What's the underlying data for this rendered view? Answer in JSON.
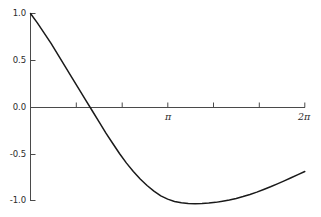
{
  "chart_data": {
    "type": "line",
    "title": "",
    "subtitle": "",
    "xlabel": "",
    "ylabel": "",
    "xlim": [
      0,
      6.283185307179586
    ],
    "ylim": [
      -1.0,
      1.0
    ],
    "grid": false,
    "legend": null,
    "background_color": "#ffffff",
    "line_color": "#1a1a1a",
    "axis_color": "#555555",
    "x_tick_positions": [
      0,
      1.0471975512,
      2.0943951024,
      3.1415926536,
      4.1887902048,
      5.235987756,
      6.2831853072
    ],
    "x_tick_labels": [
      "",
      "",
      "",
      "π",
      "",
      "",
      "2π"
    ],
    "x_labeled_ticks": [
      {
        "value": 3.1415926536,
        "label": "π"
      },
      {
        "value": 6.2831853072,
        "label": "2π"
      }
    ],
    "y_tick_positions": [
      1.0,
      0.5,
      0.0,
      -0.5,
      -1.0
    ],
    "y_tick_labels": [
      "1.0",
      "0.5",
      "0.0",
      "-0.5",
      "-1.0"
    ],
    "series": [
      {
        "name": "curve",
        "x": [
          0.0,
          0.157,
          0.314,
          0.471,
          0.628,
          0.785,
          0.942,
          1.1,
          1.257,
          1.414,
          1.571,
          1.728,
          1.885,
          2.042,
          2.199,
          2.356,
          2.513,
          2.67,
          2.827,
          2.985,
          3.142,
          3.299,
          3.456,
          3.613,
          3.77,
          3.927,
          4.084,
          4.241,
          4.398,
          4.555,
          4.712,
          4.869,
          5.027,
          5.184,
          5.341,
          5.498,
          5.655,
          5.812,
          5.969,
          6.126,
          6.283
        ],
        "y": [
          1.0,
          0.9,
          0.79,
          0.68,
          0.56,
          0.44,
          0.32,
          0.2,
          0.08,
          -0.04,
          -0.16,
          -0.28,
          -0.39,
          -0.5,
          -0.6,
          -0.69,
          -0.77,
          -0.84,
          -0.9,
          -0.95,
          -0.985,
          -1.01,
          -1.025,
          -1.033,
          -1.035,
          -1.033,
          -1.028,
          -1.02,
          -1.008,
          -0.995,
          -0.978,
          -0.958,
          -0.935,
          -0.91,
          -0.882,
          -0.853,
          -0.822,
          -0.79,
          -0.757,
          -0.723,
          -0.69
        ],
        "notable_points": {
          "start": {
            "x": 0.0,
            "y": 1.0
          },
          "zero_crossing": {
            "x": 1.44,
            "y": 0.0
          },
          "minimum": {
            "x": 3.77,
            "y": -1.035
          },
          "end": {
            "x": 6.283,
            "y": -0.69
          }
        }
      }
    ]
  },
  "axes": {
    "y_axis_name": "y-axis",
    "x_axis_name": "x-axis"
  }
}
